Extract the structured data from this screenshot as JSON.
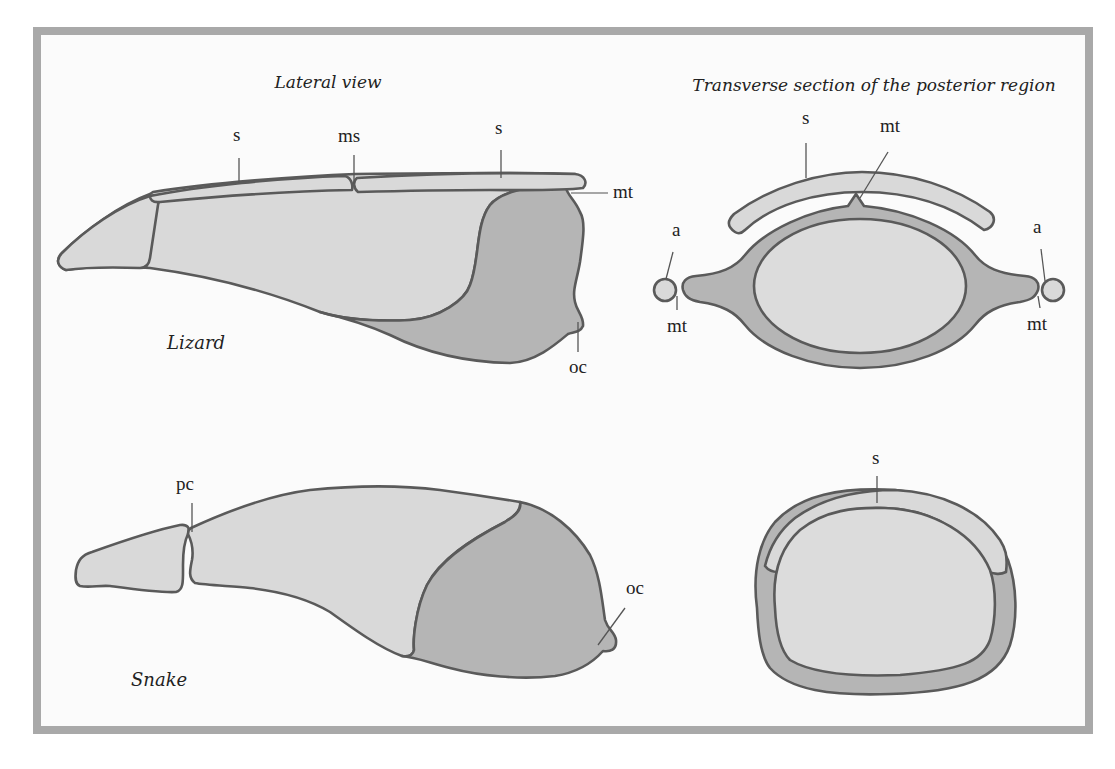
{
  "figure": {
    "panels": {
      "lateral": {
        "title": "Lateral view"
      },
      "transverse": {
        "title": "Transverse section of the posterior region"
      }
    },
    "species": {
      "lizard": "Lizard",
      "snake": "Snake"
    },
    "labels": {
      "lizard_lateral": {
        "s_left": "s",
        "ms": "ms",
        "s_right": "s",
        "mt": "mt",
        "oc": "oc"
      },
      "lizard_transverse": {
        "s": "s",
        "mt_top": "mt",
        "a_left": "a",
        "a_right": "a",
        "mt_left": "mt",
        "mt_right": "mt"
      },
      "snake_lateral": {
        "pc": "pc",
        "oc": "oc"
      },
      "snake_transverse": {
        "s": "s"
      }
    },
    "colors": {
      "frame": "#a9a9a9",
      "background": "#fbfbfb",
      "light_bone": "#d9d9d9",
      "dark_bone": "#b5b5b5",
      "outline": "#5a5a5a"
    }
  }
}
